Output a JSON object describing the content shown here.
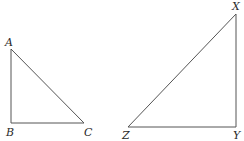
{
  "diagram": {
    "type": "geometry",
    "stroke_color": "#555555",
    "label_color": "#2a2a2a",
    "triangles": [
      {
        "name": "ABC",
        "right_angle_at": "B",
        "vertices": [
          {
            "label": "A",
            "x": 11,
            "y": 49,
            "label_x": 5,
            "label_y": 46
          },
          {
            "label": "B",
            "x": 11,
            "y": 123,
            "label_x": 6,
            "label_y": 136
          },
          {
            "label": "C",
            "x": 84,
            "y": 123,
            "label_x": 84,
            "label_y": 136
          }
        ]
      },
      {
        "name": "XYZ",
        "right_angle_at": "Y",
        "vertices": [
          {
            "label": "X",
            "x": 236,
            "y": 14,
            "label_x": 232,
            "label_y": 10
          },
          {
            "label": "Y",
            "x": 236,
            "y": 127,
            "label_x": 233,
            "label_y": 139
          },
          {
            "label": "Z",
            "x": 128,
            "y": 127,
            "label_x": 122,
            "label_y": 139
          }
        ]
      }
    ]
  }
}
